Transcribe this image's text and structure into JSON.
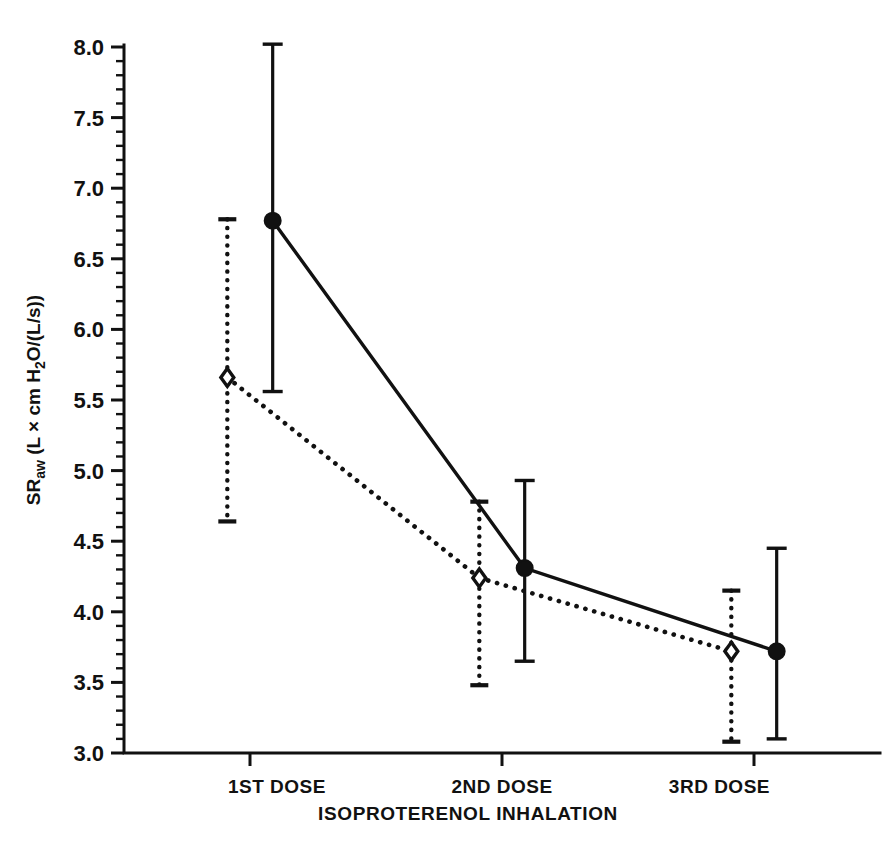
{
  "chart_data": {
    "type": "line",
    "title": "",
    "xlabel": "ISOPROTERENOL INHALATION",
    "ylabel": "SR_aw (L × cm H2O/(L/s))",
    "ylabel_parts": {
      "prefix": "SR",
      "subscript": "aw",
      "units": " (L × cm H",
      "sub2": "2",
      "suffix": "O/(L/s))"
    },
    "categories": [
      "1ST DOSE",
      "2ND DOSE",
      "3RD DOSE"
    ],
    "x": [
      1,
      2,
      3
    ],
    "ylim": [
      3.0,
      8.0
    ],
    "xlim": [
      0.5,
      3.5
    ],
    "grid": false,
    "legend": "none",
    "ytick_labels": [
      "8.0",
      "7.5",
      "7.0",
      "6.5",
      "6.0",
      "5.5",
      "5.0",
      "4.5",
      "4.0",
      "3.5",
      "3.0"
    ],
    "ytick_values": [
      8.0,
      7.5,
      7.0,
      6.5,
      6.0,
      5.5,
      5.0,
      4.5,
      4.0,
      3.5,
      3.0
    ],
    "ytick_minor_step": 0.1,
    "series": [
      {
        "name": "open-diamond-dotted",
        "marker": "open-diamond",
        "linestyle": "dotted",
        "color": "#111111",
        "x_offset": -0.09,
        "values": [
          5.66,
          4.24,
          3.72
        ],
        "err_upper": [
          6.78,
          4.78,
          4.15
        ],
        "err_lower": [
          4.64,
          3.48,
          3.08
        ]
      },
      {
        "name": "filled-circle-solid",
        "marker": "filled-circle",
        "linestyle": "solid",
        "color": "#111111",
        "x_offset": 0.09,
        "values": [
          6.77,
          4.31,
          3.72
        ],
        "err_upper": [
          8.02,
          4.93,
          4.45
        ],
        "err_lower": [
          5.56,
          3.65,
          3.1
        ]
      }
    ]
  }
}
